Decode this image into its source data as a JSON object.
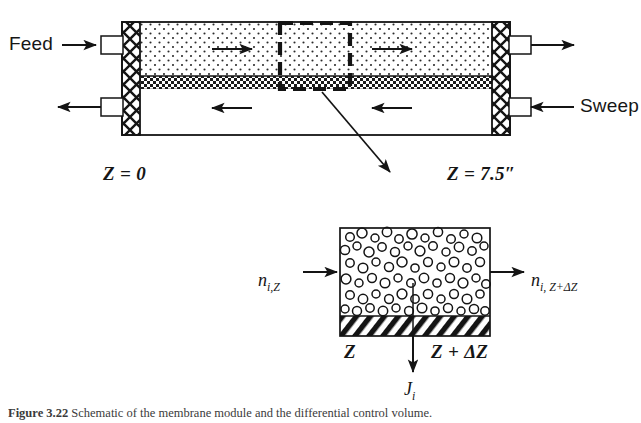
{
  "figure": {
    "domain": "scientific-diagram",
    "background_color": "#ffffff",
    "ink_color": "#161616",
    "caption_prefix": "Figure 3.22",
    "caption_text": "  Schematic of the membrane module and the differential control volume."
  },
  "module_diagram": {
    "name": "membrane-module-schematic",
    "feed_label": "Feed",
    "sweep_label": "Sweep",
    "position_start_label": "Z = 0",
    "position_end_label": "Z = 7.5″",
    "feed_channel_fill": "stippled-dots",
    "membrane_band_fill": "checkerboard",
    "sweep_channel_fill": "white",
    "tubesheet_fill": "cross-hatch-x",
    "feed_flow_direction": "right",
    "sweep_flow_direction": "left",
    "feed_arrow_count": 2,
    "sweep_arrow_count": 2,
    "control_volume_outline": "bold-dashed-rectangle"
  },
  "control_volume_detail": {
    "name": "differential-control-volume",
    "inlet_molar_flow": "n",
    "inlet_molar_flow_sub": "i,Z",
    "outlet_molar_flow": "n",
    "outlet_molar_flow_sub": "i, Z+ΔZ",
    "left_position_label": "Z",
    "right_position_label": "Z + ΔZ",
    "flux_label": "J",
    "flux_label_sub": "i",
    "gas_fill": "open-circles",
    "membrane_fill": "diagonal-hatch",
    "flux_direction": "down"
  }
}
